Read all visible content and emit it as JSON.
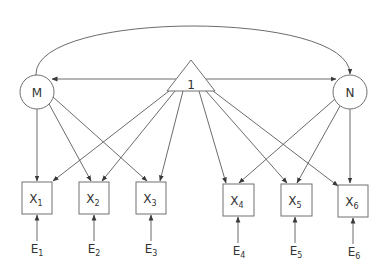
{
  "diagram": {
    "type": "structural-equation-model",
    "colors": {
      "stroke": "#707070",
      "edge": "#5a5a5a",
      "text": "#333333",
      "background": "#ffffff"
    },
    "constant": {
      "id": "one",
      "label": "1",
      "shape": "triangle"
    },
    "latent": [
      {
        "id": "M",
        "label": "M",
        "shape": "circle"
      },
      {
        "id": "N",
        "label": "N",
        "shape": "circle"
      }
    ],
    "observed": [
      {
        "id": "X1",
        "base": "X",
        "sub": "1"
      },
      {
        "id": "X2",
        "base": "X",
        "sub": "2"
      },
      {
        "id": "X3",
        "base": "X",
        "sub": "3"
      },
      {
        "id": "X4",
        "base": "X",
        "sub": "4"
      },
      {
        "id": "X5",
        "base": "X",
        "sub": "5"
      },
      {
        "id": "X6",
        "base": "X",
        "sub": "6"
      }
    ],
    "errors": [
      {
        "id": "E1",
        "base": "E",
        "sub": "1",
        "target": "X1"
      },
      {
        "id": "E2",
        "base": "E",
        "sub": "2",
        "target": "X2"
      },
      {
        "id": "E3",
        "base": "E",
        "sub": "3",
        "target": "X3"
      },
      {
        "id": "E4",
        "base": "E",
        "sub": "4",
        "target": "X4"
      },
      {
        "id": "E5",
        "base": "E",
        "sub": "5",
        "target": "X5"
      },
      {
        "id": "E6",
        "base": "E",
        "sub": "6",
        "target": "X6"
      }
    ],
    "edges": [
      {
        "from": "M",
        "to": "N",
        "type": "covariance-double-arrow"
      },
      {
        "from": "one",
        "to": "M",
        "type": "arrow"
      },
      {
        "from": "one",
        "to": "N",
        "type": "arrow"
      },
      {
        "from": "M",
        "to": "X1",
        "type": "arrow"
      },
      {
        "from": "M",
        "to": "X2",
        "type": "arrow"
      },
      {
        "from": "M",
        "to": "X3",
        "type": "arrow"
      },
      {
        "from": "N",
        "to": "X4",
        "type": "arrow"
      },
      {
        "from": "N",
        "to": "X5",
        "type": "arrow"
      },
      {
        "from": "N",
        "to": "X6",
        "type": "arrow"
      },
      {
        "from": "one",
        "to": "X1",
        "type": "arrow"
      },
      {
        "from": "one",
        "to": "X2",
        "type": "arrow"
      },
      {
        "from": "one",
        "to": "X3",
        "type": "arrow"
      },
      {
        "from": "one",
        "to": "X4",
        "type": "arrow"
      },
      {
        "from": "one",
        "to": "X5",
        "type": "arrow"
      },
      {
        "from": "one",
        "to": "X6",
        "type": "arrow"
      },
      {
        "from": "E1",
        "to": "X1",
        "type": "arrow"
      },
      {
        "from": "E2",
        "to": "X2",
        "type": "arrow"
      },
      {
        "from": "E3",
        "to": "X3",
        "type": "arrow"
      },
      {
        "from": "E4",
        "to": "X4",
        "type": "arrow"
      },
      {
        "from": "E5",
        "to": "X5",
        "type": "arrow"
      },
      {
        "from": "E6",
        "to": "X6",
        "type": "arrow"
      }
    ]
  }
}
